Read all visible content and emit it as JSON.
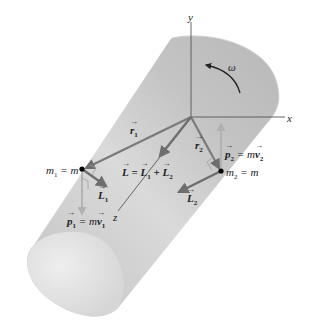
{
  "figure": {
    "type": "physics-diagram",
    "colors": {
      "cylinder_body": "#c8c8c8",
      "cylinder_highlight": "#e8e8e8",
      "cylinder_end": "#e2e2e2",
      "axis_line": "#555555",
      "position_vector": "#7a7a7a",
      "angular_momentum_vector": "#6e6e6e",
      "momentum_vector": "#b0b0b0",
      "mass_dot": "#000000",
      "background": "#ffffff"
    }
  },
  "axes": {
    "x_label": "x",
    "y_label": "y",
    "z_label": "z"
  },
  "rotation": {
    "label": "ω"
  },
  "vectors": {
    "r1": {
      "symbol": "r",
      "sub": "1"
    },
    "r2": {
      "symbol": "r",
      "sub": "2"
    },
    "L_total": {
      "lhs": "L",
      "eq": " = ",
      "t1": "L",
      "t1sub": "1",
      "plus": " + ",
      "t2": "L",
      "t2sub": "2"
    },
    "L1": {
      "symbol": "L",
      "sub": "1"
    },
    "L2": {
      "symbol": "L",
      "sub": "2"
    },
    "p1": {
      "symbol": "p",
      "sub": "1",
      "eq": " = m",
      "v": "v",
      "vsub": "1"
    },
    "p2": {
      "symbol": "p",
      "sub": "2",
      "eq": " = m",
      "v": "v",
      "vsub": "2"
    }
  },
  "masses": {
    "m1": {
      "name": "m",
      "sub": "1",
      "eq": " = m"
    },
    "m2": {
      "name": "m",
      "sub": "2",
      "eq": " = m"
    }
  }
}
